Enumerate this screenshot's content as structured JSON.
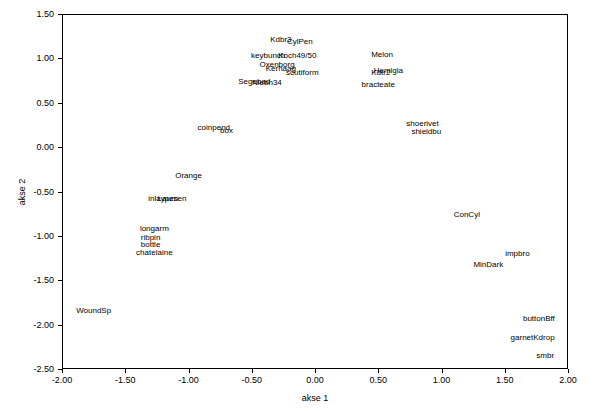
{
  "chart_data": {
    "type": "scatter",
    "title": "",
    "xlabel": "akse 1",
    "ylabel": "akse 2",
    "xlim": [
      -2.0,
      2.0
    ],
    "ylim": [
      -2.5,
      1.5
    ],
    "xticks": [
      -2.0,
      -1.5,
      -1.0,
      -0.5,
      0.0,
      0.5,
      1.0,
      1.5,
      2.0
    ],
    "xticklabels": [
      "-2.00",
      "-1.50",
      "-1.00",
      "-0.50",
      "0.00",
      "0.50",
      "1.00",
      "1.50",
      "2.00"
    ],
    "yticks": [
      -2.5,
      -2.0,
      -1.5,
      -1.0,
      -0.5,
      0.0,
      0.5,
      1.0,
      1.5
    ],
    "yticklabels": [
      "-2.50",
      "-2.00",
      "-1.50",
      "-1.00",
      "-0.50",
      "0.00",
      "0.50",
      "1.00",
      "1.50"
    ],
    "grid": false,
    "legend": false,
    "marker": "text-label",
    "points": [
      {
        "label": "Kdbr3",
        "x": -0.27,
        "y": 1.21
      },
      {
        "label": "CylPen",
        "x": -0.12,
        "y": 1.19
      },
      {
        "label": "keybunch",
        "x": -0.37,
        "y": 1.03
      },
      {
        "label": "Koch49/50",
        "x": -0.14,
        "y": 1.03
      },
      {
        "label": "Melon",
        "x": 0.53,
        "y": 1.04
      },
      {
        "label": "Oxenborg",
        "x": -0.3,
        "y": 0.92
      },
      {
        "label": "Kerhaag",
        "x": -0.27,
        "y": 0.88
      },
      {
        "label": "Hemigla",
        "x": 0.58,
        "y": 0.86
      },
      {
        "label": "Kdtr2",
        "x": 0.52,
        "y": 0.84
      },
      {
        "label": "scutiform",
        "x": -0.1,
        "y": 0.83
      },
      {
        "label": "Segebad",
        "x": -0.48,
        "y": 0.73
      },
      {
        "label": "Niebh34",
        "x": -0.38,
        "y": 0.72
      },
      {
        "label": "bracteate",
        "x": 0.5,
        "y": 0.7
      },
      {
        "label": "coinpend",
        "x": -0.8,
        "y": 0.22
      },
      {
        "label": "box",
        "x": -0.7,
        "y": 0.18
      },
      {
        "label": "shoerivet",
        "x": 0.85,
        "y": 0.26
      },
      {
        "label": "shieldbu",
        "x": 0.88,
        "y": 0.17
      },
      {
        "label": "Orange",
        "x": -1.0,
        "y": -0.33
      },
      {
        "label": "inlaypen",
        "x": -1.2,
        "y": -0.58
      },
      {
        "label": "Laursen",
        "x": -1.13,
        "y": -0.59
      },
      {
        "label": "ConCyl",
        "x": 1.2,
        "y": -0.77
      },
      {
        "label": "longarm",
        "x": -1.27,
        "y": -0.92
      },
      {
        "label": "ribpin",
        "x": -1.3,
        "y": -1.02
      },
      {
        "label": "bottle",
        "x": -1.3,
        "y": -1.1
      },
      {
        "label": "chatelaine",
        "x": -1.27,
        "y": -1.19
      },
      {
        "label": "impbro",
        "x": 1.6,
        "y": -1.2
      },
      {
        "label": "MinDark",
        "x": 1.37,
        "y": -1.33
      },
      {
        "label": "WoundSp",
        "x": -1.75,
        "y": -1.85
      },
      {
        "label": "buttonBff",
        "x": 1.77,
        "y": -1.94
      },
      {
        "label": "garnetKdrop",
        "x": 1.72,
        "y": -2.15
      },
      {
        "label": "smbr",
        "x": 1.82,
        "y": -2.35
      }
    ]
  }
}
